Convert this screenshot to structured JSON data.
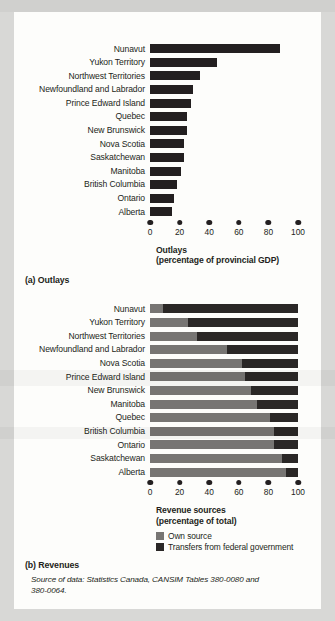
{
  "figure": {
    "panel_a_caption": "(a) Outlays",
    "panel_b_caption": "(b) Revenues",
    "source_note_line1": "Source of data: Statistics Canada, CANSIM Tables 380-0080 and",
    "source_note_line2": "380-0064."
  },
  "colors": {
    "bar_dark": "#231f20",
    "own_source_gray": "#777573",
    "transfer_dark": "#2a2726",
    "page_background": "#d8d8d6",
    "card_background": "#fdfdfb"
  },
  "axis": {
    "ticks": [
      "0",
      "20",
      "40",
      "60",
      "80",
      "100"
    ],
    "tick_values": [
      0,
      20,
      40,
      60,
      80,
      100
    ],
    "min": 0,
    "max": 100
  },
  "outlays_axis_title": {
    "line1": "Outlays",
    "line2": "(percentage of provincial GDP)"
  },
  "revenues_axis_title": {
    "line1": "Revenue sources",
    "line2": "(percentage of total)"
  },
  "legend": {
    "items": [
      {
        "label": "Own source",
        "color": "#777573",
        "swatch_name": "own-source-swatch"
      },
      {
        "label": "Transfers from federal government",
        "color": "#2a2726",
        "swatch_name": "transfer-swatch"
      }
    ]
  },
  "chart_data": [
    {
      "id": "outlays",
      "type": "bar",
      "orientation": "horizontal",
      "title": "(a) Outlays",
      "xlabel": "Outlays (percentage of provincial GDP)",
      "ylabel": "",
      "xlim": [
        0,
        100
      ],
      "grid": false,
      "legend": "none",
      "categories": [
        "Nunavut",
        "Yukon Territory",
        "Northwest Territories",
        "Newfoundland and Labrador",
        "Prince Edward Island",
        "Quebec",
        "New Brunswick",
        "Nova Scotia",
        "Saskatchewan",
        "Manitoba",
        "British Columbia",
        "Ontario",
        "Alberta"
      ],
      "values": [
        88,
        45,
        34,
        29,
        28,
        25,
        25,
        23,
        23,
        21,
        18,
        16,
        15
      ]
    },
    {
      "id": "revenues",
      "type": "bar",
      "orientation": "horizontal",
      "stacked": true,
      "title": "(b) Revenues",
      "xlabel": "Revenue sources (percentage of total)",
      "ylabel": "",
      "xlim": [
        0,
        100
      ],
      "grid": false,
      "legend": "bottom-left",
      "categories": [
        "Nunavut",
        "Yukon Territory",
        "Northwest Territories",
        "Newfoundland and Labrador",
        "Nova Scotia",
        "Prince Edward Island",
        "New Brunswick",
        "Manitoba",
        "Quebec",
        "British Columbia",
        "Ontario",
        "Saskatchewan",
        "Alberta"
      ],
      "series": [
        {
          "name": "Own source",
          "color": "#777573",
          "values": [
            9,
            26,
            32,
            52,
            62,
            64,
            68,
            72,
            81,
            84,
            84,
            89,
            92
          ]
        },
        {
          "name": "Transfers from federal government",
          "color": "#2a2726",
          "values": [
            91,
            74,
            68,
            48,
            38,
            36,
            32,
            28,
            19,
            16,
            16,
            11,
            8
          ]
        }
      ]
    }
  ]
}
